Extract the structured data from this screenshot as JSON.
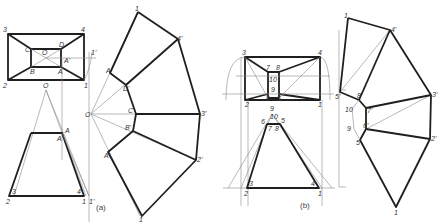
{
  "figure": {
    "panels": [
      {
        "caption": "(a)",
        "plan_labels": {
          "c3": "3",
          "c4": "4",
          "c2": "2",
          "c1": "1",
          "C": "C",
          "D": "D",
          "O": "O",
          "B": "B",
          "A": "A",
          "A1": "A'",
          "one_prime": "1'"
        },
        "elevation_labels": {
          "O": "O",
          "A": "A",
          "A1": "A'",
          "b3": "3",
          "b4": "4",
          "b2": "2",
          "b1": "1",
          "b1p": "1'"
        },
        "development_labels": {
          "top1": "1",
          "p4": "4'",
          "A": "A",
          "D": "D'",
          "O": "O",
          "C": "C'",
          "p3": "3'",
          "B": "B'",
          "A2": "A'",
          "p2": "2'",
          "bot1": "1"
        }
      },
      {
        "caption": "(b)",
        "plan_labels": {
          "c3": "3",
          "c4": "4",
          "c2": "2",
          "c1": "1",
          "n7": "7",
          "n8": "8",
          "n10": "10",
          "n9": "9",
          "n6": "6",
          "n5": "5"
        },
        "elevation_labels": {
          "n9": "9",
          "n10": "10",
          "n6": "6",
          "n5": "5",
          "n7": "7",
          "n8": "8",
          "b3": "3",
          "b4": "4",
          "b2": "2",
          "b1": "1"
        },
        "development_labels": {
          "top1": "1",
          "p4": "4'",
          "p5": "5'",
          "p8": "8'",
          "p3": "3'",
          "n10": "10",
          "p7": "7'",
          "n9": "9",
          "p6": "6'",
          "n5": "5",
          "p2": "2'",
          "bot1": "1"
        }
      }
    ]
  }
}
